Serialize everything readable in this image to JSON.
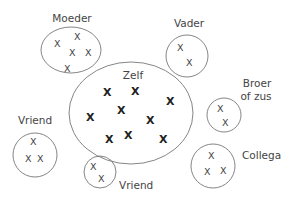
{
  "diagram": {
    "type": "social-network-circles",
    "nodes": [
      {
        "id": "moeder",
        "label": "Moeder",
        "marks": 5
      },
      {
        "id": "vader",
        "label": "Vader",
        "marks": 2
      },
      {
        "id": "zelf",
        "label": "Zelf",
        "marks": 10
      },
      {
        "id": "broer_of_zus",
        "label_line1": "Broer",
        "label_line2": "of zus",
        "marks": 2
      },
      {
        "id": "vriend_left",
        "label": "Vriend",
        "marks": 3
      },
      {
        "id": "vriend_bottom",
        "label": "Vriend",
        "marks": 2
      },
      {
        "id": "collega",
        "label": "Collega",
        "marks": 3
      }
    ],
    "mark_glyph": "X"
  }
}
